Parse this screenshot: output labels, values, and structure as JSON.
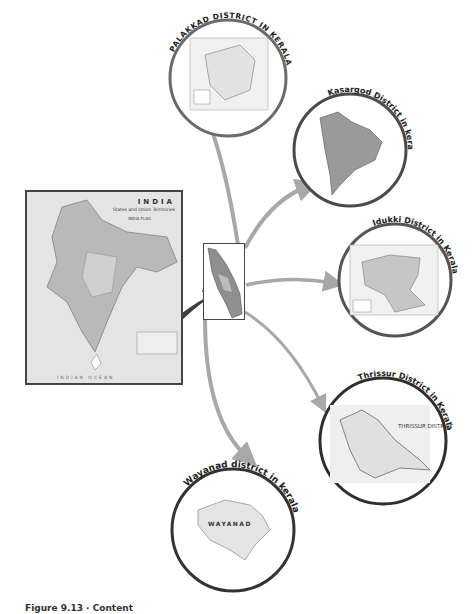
{
  "caption": "Figure 9.13 · Content",
  "source_map": {
    "title": "INDIA",
    "subtitle": "States and Union Territories",
    "legend_flag": "INDIA FLAG",
    "ocean_label": "INDIAN OCEAN"
  },
  "center_map": {
    "label": "Kerala"
  },
  "districts": [
    {
      "label": "PALAKKAD DISTRICT IN KERALA",
      "cx": 228,
      "cy": 78,
      "r": 60
    },
    {
      "label": "Kasargod District in kerala",
      "cx": 350,
      "cy": 150,
      "r": 58
    },
    {
      "label": "Idukki District in Kerala",
      "cx": 395,
      "cy": 280,
      "r": 58
    },
    {
      "label": "Thrissur District in Kerala",
      "cx": 383,
      "cy": 441,
      "r": 65
    },
    {
      "label": "Wayanad district in kerala",
      "cx": 233,
      "cy": 530,
      "r": 63
    }
  ],
  "thrissur_inner_label": "THRISSUR DISTRICT",
  "wayanad_inner_label": "WAYANAD",
  "colors": {
    "circle_stroke": "#3a3a3a",
    "arrow": "#a8a8a8",
    "big_arrow": "#3d3d3d",
    "map_fill": "#c9c9c9"
  }
}
